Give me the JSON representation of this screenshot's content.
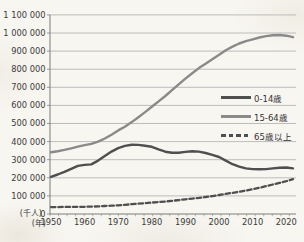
{
  "chart_data": {
    "type": "line",
    "title": "",
    "y_unit_label": "(千人)",
    "x_unit_label": "(年)",
    "grid": true,
    "legend_position": "middle-right",
    "xlim": [
      1950,
      2023
    ],
    "ylim": [
      0,
      1100000
    ],
    "x_tick_labels": [
      "1950",
      "1960",
      "1970",
      "1980",
      "1990",
      "2000",
      "2010",
      "2020"
    ],
    "y_tick_labels": [
      "0",
      "100 000",
      "200 000",
      "300 000",
      "400 000",
      "500 000",
      "600 000",
      "700 000",
      "800 000",
      "900 000",
      "1 000 000",
      "1 100 000"
    ],
    "colors": {
      "age_0_14": "#4f4f4f",
      "age_15_64": "#8a8a8a",
      "age_65_plus": "#4f4f4f",
      "gridline": "#adadad",
      "axis": "#7d7d7d",
      "text": "#3b3b3b"
    },
    "x": [
      1950,
      1952,
      1954,
      1956,
      1958,
      1960,
      1962,
      1964,
      1966,
      1968,
      1970,
      1972,
      1974,
      1976,
      1978,
      1980,
      1982,
      1984,
      1986,
      1988,
      1990,
      1992,
      1994,
      1996,
      1998,
      2000,
      2002,
      2004,
      2006,
      2008,
      2010,
      2012,
      2014,
      2016,
      2018,
      2020,
      2022
    ],
    "series": [
      {
        "key": "age-0-14",
        "name": "0-14歳",
        "color": "#4f4f4f",
        "width": 2.4,
        "dash": "",
        "values": [
          205000,
          218000,
          233000,
          250000,
          266000,
          271000,
          274000,
          295000,
          320000,
          345000,
          364000,
          376000,
          383000,
          382000,
          377000,
          371000,
          357000,
          344000,
          338000,
          338000,
          343000,
          347000,
          345000,
          337000,
          327000,
          315000,
          295000,
          275000,
          262000,
          252000,
          248000,
          247000,
          248000,
          252000,
          256000,
          257000,
          252000
        ]
      },
      {
        "key": "age-15-64",
        "name": "15-64歳",
        "color": "#8a8a8a",
        "width": 2.4,
        "dash": "",
        "values": [
          341000,
          347000,
          354000,
          363000,
          372000,
          380000,
          388000,
          400000,
          417000,
          438000,
          462000,
          482000,
          508000,
          535000,
          563000,
          592000,
          622000,
          652000,
          684000,
          716000,
          748000,
          778000,
          806000,
          830000,
          855000,
          880000,
          905000,
          925000,
          942000,
          955000,
          965000,
          975000,
          983000,
          988000,
          989000,
          985000,
          977000
        ]
      },
      {
        "key": "age-65-plus",
        "name": "65歳以上",
        "color": "#4f4f4f",
        "width": 2.3,
        "dash": "4.5 2.8",
        "values": [
          38000,
          38000,
          39000,
          39000,
          40000,
          40000,
          41000,
          42000,
          44000,
          46000,
          48000,
          51000,
          54000,
          57000,
          60000,
          63000,
          66000,
          69000,
          73000,
          77000,
          81000,
          85000,
          89000,
          94000,
          99000,
          105000,
          111000,
          117000,
          123000,
          130000,
          137000,
          145000,
          154000,
          163000,
          172000,
          181000,
          192000
        ]
      }
    ]
  }
}
